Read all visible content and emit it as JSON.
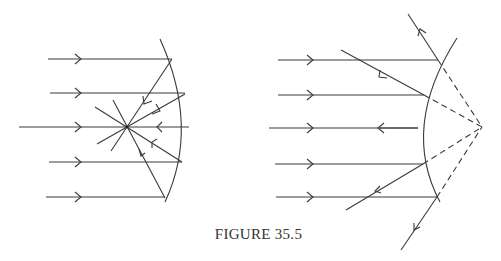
{
  "figure": {
    "caption": "FIGURE 35.5",
    "colors": {
      "line": "#3a3a3a",
      "background": "#ffffff"
    },
    "panels": [
      {
        "name": "concave-mirror",
        "description": "Parallel rays reflect from a concave mirror and converge at the focal point",
        "incident_rays": 5,
        "ray_arrows": "right",
        "reflected_arrows": "toward focus"
      },
      {
        "name": "convex-mirror",
        "description": "Parallel rays reflect from a convex mirror and diverge as if from a virtual focal point behind the mirror",
        "incident_rays": 5,
        "ray_arrows": "right",
        "reflected_arrows": "away from mirror",
        "virtual_rays": "dashed"
      }
    ]
  }
}
